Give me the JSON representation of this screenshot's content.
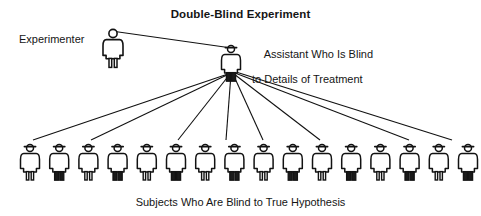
{
  "diagram": {
    "title": "Double-Blind Experiment",
    "background_color": "#ffffff",
    "ink_color": "#111111",
    "width": 481,
    "height": 216
  },
  "nodes": {
    "experimenter": {
      "label": "Experimenter",
      "figure_type": "person-no-hat",
      "x": 113,
      "y": 34
    },
    "assistant": {
      "label_line1": "Assistant Who Is Blind",
      "label_line2": "to Details of Treatment",
      "label_full": "Assistant Who Is Blind to Details of Treatment",
      "figure_type": "person-with-hat",
      "x": 231,
      "y": 40
    }
  },
  "subjects": {
    "caption": "Subjects Who Are Blind to True Hypothesis",
    "count": 16,
    "first_x": 30,
    "spacing": 29.2,
    "top_y": 146,
    "items": [
      {
        "index": 1,
        "style": "skirt"
      },
      {
        "index": 2,
        "style": "trousers"
      },
      {
        "index": 3,
        "style": "skirt"
      },
      {
        "index": 4,
        "style": "trousers"
      },
      {
        "index": 5,
        "style": "skirt"
      },
      {
        "index": 6,
        "style": "trousers"
      },
      {
        "index": 7,
        "style": "skirt"
      },
      {
        "index": 8,
        "style": "trousers"
      },
      {
        "index": 9,
        "style": "skirt"
      },
      {
        "index": 10,
        "style": "trousers"
      },
      {
        "index": 11,
        "style": "skirt"
      },
      {
        "index": 12,
        "style": "trousers"
      },
      {
        "index": 13,
        "style": "skirt"
      },
      {
        "index": 14,
        "style": "trousers"
      },
      {
        "index": 15,
        "style": "skirt"
      },
      {
        "index": 16,
        "style": "trousers"
      }
    ]
  },
  "connections": {
    "experimenter_to_assistant": {
      "from": "experimenter",
      "to": "assistant"
    },
    "assistant_to_subject_indices": [
      1,
      3,
      6,
      8,
      9,
      11,
      14,
      16
    ]
  }
}
